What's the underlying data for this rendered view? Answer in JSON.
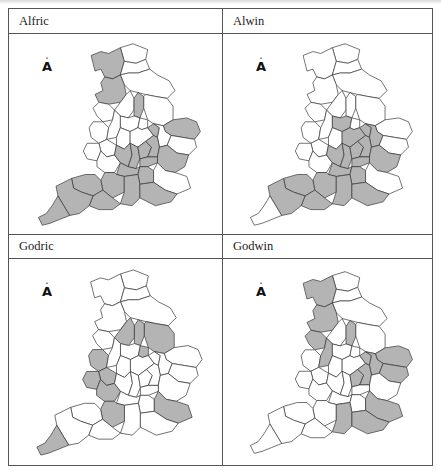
{
  "figure": {
    "shade_color": "#b4b4b4",
    "unshaded_color": "#ffffff",
    "north_arrow_glyph": "A",
    "panels": [
      {
        "name": "Alfric",
        "shaded_counties": [
          "Cumbria",
          "Lancashire",
          "Nottinghamshire",
          "Norfolk",
          "Huntingdonshire",
          "Essex",
          "Cornwall",
          "Devon",
          "Somerset",
          "Dorset",
          "Wiltshire",
          "Hampshire",
          "Berkshire",
          "Surrey",
          "Sussex",
          "Oxfordshire",
          "Buckinghamshire",
          "Hertfordshire",
          "Middlesex",
          "Bedfordshire"
        ]
      },
      {
        "name": "Alwin",
        "shaded_counties": [
          "Leicestershire",
          "Northamptonshire",
          "Huntingdonshire",
          "Bedfordshire",
          "Cambridgeshire",
          "Buckinghamshire",
          "Hertfordshire",
          "Oxfordshire",
          "Essex",
          "Middlesex",
          "Berkshire",
          "Wiltshire",
          "Hampshire",
          "Surrey",
          "Sussex",
          "Somerset",
          "Devon",
          "Dorset"
        ]
      },
      {
        "name": "Godric",
        "shaded_counties": [
          "Derbyshire",
          "Nottinghamshire",
          "Lincolnshire",
          "Rutland",
          "Shropshire",
          "Worcestershire",
          "Herefordshire",
          "Gloucestershire",
          "Wiltshire",
          "Kent",
          "Cornwall"
        ]
      },
      {
        "name": "Godwin",
        "shaded_counties": [
          "Cumbria",
          "Lancashire",
          "Cheshire",
          "Staffordshire",
          "Nottinghamshire",
          "Norfolk",
          "Suffolk",
          "Cambridgeshire",
          "Huntingdonshire",
          "Bedfordshire",
          "Hertfordshire",
          "Hampshire",
          "Kent",
          "Sussex"
        ]
      }
    ]
  }
}
